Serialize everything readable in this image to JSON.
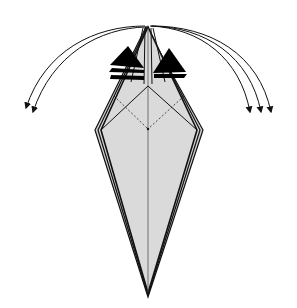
{
  "diagram": {
    "type": "origami-step",
    "colors": {
      "paper_fill": "#d9d9d9",
      "outline": "#111111",
      "flap_fill": "#000000",
      "arrow": "#111111",
      "background": "#ffffff"
    },
    "arrows": {
      "left_count": 2,
      "right_count": 3,
      "direction": "outward-down"
    },
    "fold_lines": {
      "center_crease": "solid",
      "inner_diamond": "dashed (valley)",
      "diagonals": "solid"
    }
  }
}
